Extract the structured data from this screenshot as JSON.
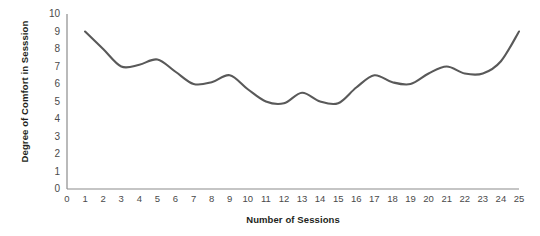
{
  "chart_data": {
    "type": "line",
    "title": "",
    "xlabel": "Number of Sessions",
    "ylabel": "Degree of Comfort in Sesssion",
    "xlim": [
      0,
      25
    ],
    "ylim": [
      0,
      10
    ],
    "grid": false,
    "legend": null,
    "line_color": "#595959",
    "axis_color": "#8c8c8c",
    "x": [
      1,
      2,
      3,
      4,
      5,
      6,
      7,
      8,
      9,
      10,
      11,
      12,
      13,
      14,
      15,
      16,
      17,
      18,
      19,
      20,
      21,
      22,
      23,
      24,
      25
    ],
    "values": [
      9,
      8,
      7,
      7.1,
      7.4,
      6.7,
      6,
      6.1,
      6.5,
      5.7,
      5,
      4.9,
      5.5,
      5,
      4.9,
      5.8,
      6.5,
      6.1,
      6,
      6.6,
      7,
      6.6,
      6.6,
      7.3,
      9
    ],
    "x_tick_labels": [
      "0",
      "1",
      "2",
      "3",
      "4",
      "5",
      "6",
      "7",
      "8",
      "9",
      "10",
      "11",
      "12",
      "13",
      "14",
      "15",
      "16",
      "17",
      "18",
      "19",
      "20",
      "21",
      "22",
      "23",
      "24",
      "25"
    ],
    "y_tick_labels": [
      "0",
      "1",
      "2",
      "3",
      "4",
      "5",
      "6",
      "7",
      "8",
      "9",
      "10"
    ]
  }
}
